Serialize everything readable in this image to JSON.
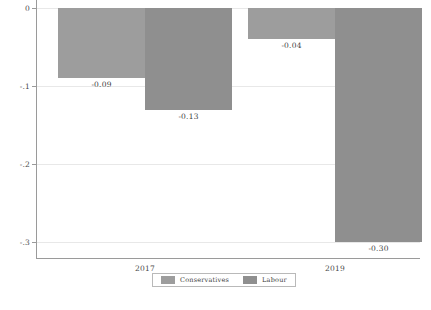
{
  "chart_data": {
    "type": "bar",
    "title": "",
    "subtitle": "",
    "xlabel": "",
    "ylabel": "",
    "categories": [
      "2017",
      "2019"
    ],
    "series": [
      {
        "name": "Conservatives",
        "color": "#9d9d9d",
        "values": [
          -0.09,
          -0.04
        ],
        "labels": [
          "-0.09",
          "-0.04"
        ]
      },
      {
        "name": "Labour",
        "color": "#8f8f8f",
        "values": [
          -0.13,
          -0.3
        ],
        "labels": [
          "-0.13",
          "-0.30"
        ]
      }
    ],
    "ylim": [
      -0.32,
      0
    ],
    "yticks": [
      0,
      -0.1,
      -0.2,
      -0.3
    ],
    "ytick_labels": [
      "0",
      "-.1",
      "-.2",
      "-.3"
    ],
    "grid": true,
    "legend_position": "bottom",
    "axis_color": "#9a9a9a",
    "grid_color": "#e8e8e8",
    "background": "#ffffff"
  },
  "legend": {
    "entries": [
      {
        "label": "Conservatives"
      },
      {
        "label": "Labour"
      }
    ]
  }
}
